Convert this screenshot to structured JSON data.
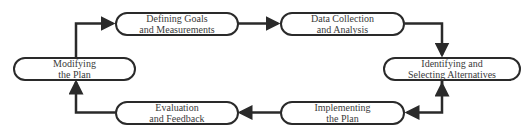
{
  "diagram": {
    "type": "cycle-flowchart",
    "stroke_color": "#2a2a2a",
    "text_color": "#3a3a3a",
    "nodes": [
      {
        "id": "defining",
        "line1": "Defining Goals",
        "line2": "and Measurements"
      },
      {
        "id": "data",
        "line1": "Data Collection",
        "line2": "and Analysis"
      },
      {
        "id": "identifying",
        "line1": "Identifying and",
        "line2": "Selecting Alternatives"
      },
      {
        "id": "implementing",
        "line1": "Implementing",
        "line2": "the Plan"
      },
      {
        "id": "evaluation",
        "line1": "Evaluation",
        "line2": "and Feedback"
      },
      {
        "id": "modifying",
        "line1": "Modifying",
        "line2": "the Plan"
      }
    ],
    "edges": [
      {
        "from": "defining",
        "to": "data"
      },
      {
        "from": "data",
        "to": "identifying"
      },
      {
        "from": "identifying",
        "to": "implementing"
      },
      {
        "from": "implementing",
        "to": "evaluation"
      },
      {
        "from": "evaluation",
        "to": "modifying"
      },
      {
        "from": "modifying",
        "to": "defining"
      }
    ]
  }
}
